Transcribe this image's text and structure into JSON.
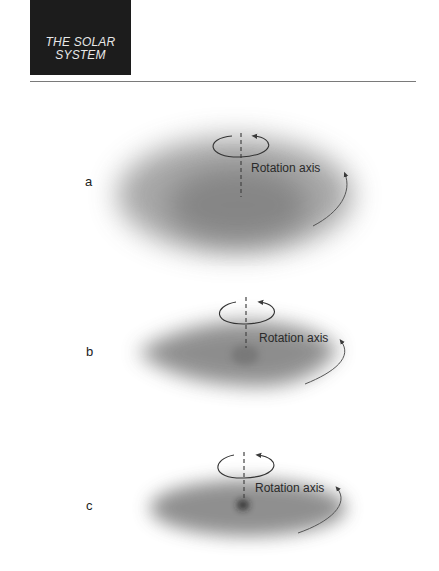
{
  "header": {
    "title_line1": "THE SOLAR",
    "title_line2": "SYSTEM"
  },
  "panels": [
    {
      "label": "a",
      "axis_label": "Rotation axis",
      "shape": "large-ellipse-cloud"
    },
    {
      "label": "b",
      "axis_label": "Rotation axis",
      "shape": "flattened-lens-cloud"
    },
    {
      "label": "c",
      "axis_label": "Rotation axis",
      "shape": "flat-disk-with-dense-core"
    }
  ],
  "colors": {
    "header_bg": "#1c1c1c",
    "header_text": "#e8e8e8",
    "cloud": "#6e6e6e",
    "arrow": "#3a3a3a",
    "axis_dash": "#555555"
  }
}
